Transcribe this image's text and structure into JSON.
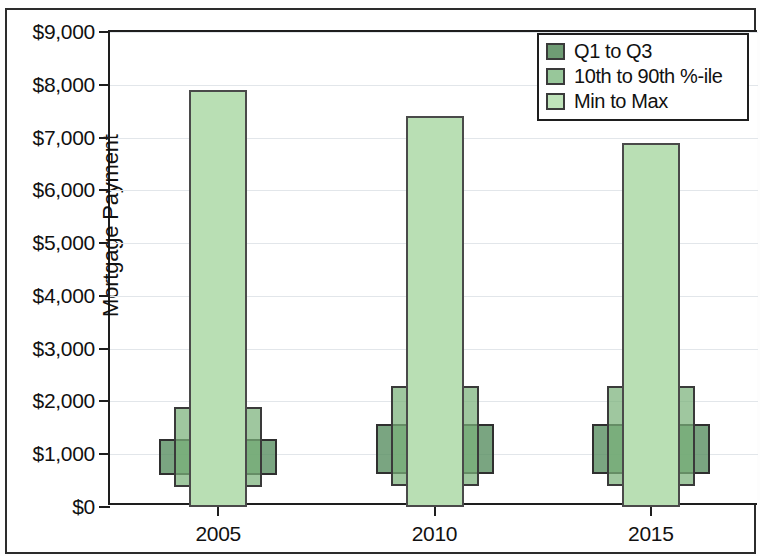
{
  "chart_data": {
    "type": "bar",
    "title": "",
    "subtitle": "",
    "xlabel": "",
    "ylabel": "Mortgage Payment",
    "categories": [
      "2005",
      "2010",
      "2015"
    ],
    "ylim": [
      0,
      9000
    ],
    "y_ticks": [
      0,
      1000,
      2000,
      3000,
      4000,
      5000,
      6000,
      7000,
      8000,
      9000
    ],
    "y_tick_labels": [
      "$0",
      "$1,000",
      "$2,000",
      "$3,000",
      "$4,000",
      "$5,000",
      "$6,000",
      "$7,000",
      "$8,000",
      "$9,000"
    ],
    "grid": true,
    "legend_position": "top-right",
    "legend": [
      {
        "label": "Q1 to Q3",
        "color": "#6f9c74",
        "swatch": "quartile"
      },
      {
        "label": "10th to 90th %-ile",
        "color": "#98c79a",
        "swatch": "decile"
      },
      {
        "label": "Min to Max",
        "color": "#bfe3ba",
        "swatch": "minmax"
      }
    ],
    "series": [
      {
        "name": "Min to Max",
        "key": "minmax",
        "width_px": 58,
        "color": "#bfe3ba",
        "values": [
          {
            "category": "2005",
            "low": 0,
            "high": 7900
          },
          {
            "category": "2010",
            "low": 0,
            "high": 7400
          },
          {
            "category": "2015",
            "low": 0,
            "high": 6900
          }
        ]
      },
      {
        "name": "10th to 90th %-ile",
        "key": "decile",
        "width_px": 88,
        "color": "#98c79a",
        "values": [
          {
            "category": "2005",
            "low": 380,
            "high": 1900
          },
          {
            "category": "2010",
            "low": 390,
            "high": 2300
          },
          {
            "category": "2015",
            "low": 390,
            "high": 2300
          }
        ]
      },
      {
        "name": "Q1 to Q3",
        "key": "quartile",
        "width_px": 118,
        "color": "#6f9c74",
        "values": [
          {
            "category": "2005",
            "low": 600,
            "high": 1280
          },
          {
            "category": "2010",
            "low": 620,
            "high": 1580
          },
          {
            "category": "2015",
            "low": 620,
            "high": 1580
          }
        ]
      }
    ]
  }
}
